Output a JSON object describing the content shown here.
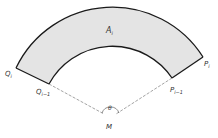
{
  "diagram": {
    "type": "annular-sector",
    "colors": {
      "fill": "#e4e4e4",
      "stroke": "#1a1a1a",
      "dashed": "#666666",
      "text": "#333333"
    },
    "labels": {
      "region": {
        "main": "A",
        "sub": "i"
      },
      "outer_left": {
        "main": "Q",
        "sub": "i"
      },
      "inner_left": {
        "main": "Q",
        "sub": "i−1"
      },
      "outer_right": {
        "main": "P",
        "sub": "i"
      },
      "inner_right": {
        "main": "P",
        "sub": "i−1"
      },
      "angle": "θ",
      "center": "M"
    }
  }
}
